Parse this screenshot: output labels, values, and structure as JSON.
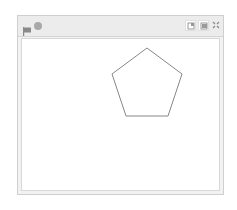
{
  "stage": {
    "header": {
      "green_flag": {
        "icon": "green-flag-icon"
      },
      "stop": {
        "icon": "stop-icon"
      },
      "buttons": [
        {
          "name": "small-stage-button",
          "icon": "small-stage-icon"
        },
        {
          "name": "normal-stage-button",
          "icon": "normal-stage-icon"
        },
        {
          "name": "fullscreen-button",
          "icon": "fullscreen-icon"
        }
      ]
    },
    "canvas": {
      "shape": "pentagon",
      "stroke_color": "#888888",
      "points": "125,9 160,35 146,77 104,77 90,35"
    }
  }
}
